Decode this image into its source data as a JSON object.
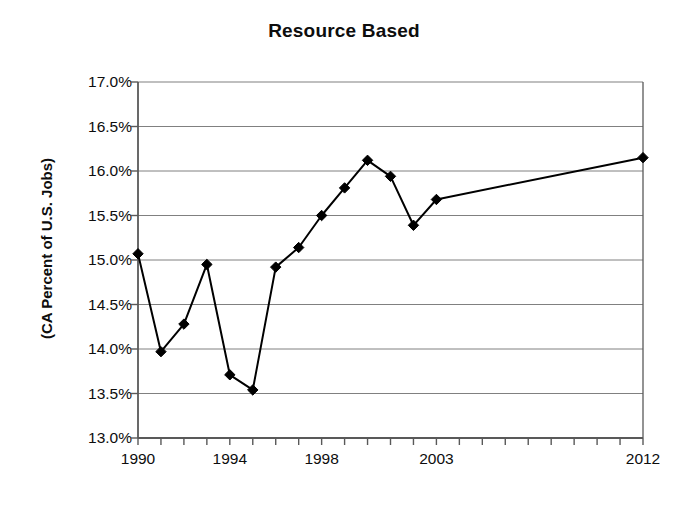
{
  "chart_data": {
    "type": "line",
    "title": "Resource Based",
    "xlabel": "",
    "ylabel": "(CA Percent of U.S. Jobs)",
    "ylim": [
      13.0,
      17.0
    ],
    "xlim": [
      1990,
      2012
    ],
    "grid": true,
    "legend": "none",
    "marker": "diamond",
    "line_color": "#000000",
    "marker_color": "#000000",
    "grid_color": "#808080",
    "axis_color": "#595959",
    "y_ticks": [
      13.0,
      13.5,
      14.0,
      14.5,
      15.0,
      15.5,
      16.0,
      16.5,
      17.0
    ],
    "y_tick_labels": [
      "13.0%",
      "13.5%",
      "14.0%",
      "14.5%",
      "15.0%",
      "15.5%",
      "16.0%",
      "16.5%",
      "17.0%"
    ],
    "x_ticks": [
      1990,
      1991,
      1992,
      1993,
      1994,
      1995,
      1996,
      1997,
      1998,
      1999,
      2000,
      2001,
      2002,
      2003,
      2004,
      2005,
      2006,
      2007,
      2008,
      2009,
      2010,
      2011,
      2012
    ],
    "x_tick_labels_shown": [
      "1990",
      "1994",
      "1998",
      "2003",
      "2012"
    ],
    "x_tick_labels_shown_values": [
      1990,
      1994,
      1998,
      2003,
      2012
    ],
    "x": [
      1990,
      1991,
      1992,
      1993,
      1994,
      1995,
      1996,
      1997,
      1998,
      1999,
      2000,
      2001,
      2002,
      2003,
      2012
    ],
    "values": [
      15.07,
      13.97,
      14.28,
      14.95,
      13.71,
      13.54,
      14.92,
      15.14,
      15.5,
      15.81,
      16.12,
      15.94,
      15.39,
      15.68,
      16.15
    ],
    "series": [
      {
        "name": "Resource Based",
        "x": [
          1990,
          1991,
          1992,
          1993,
          1994,
          1995,
          1996,
          1997,
          1998,
          1999,
          2000,
          2001,
          2002,
          2003,
          2012
        ],
        "values": [
          15.07,
          13.97,
          14.28,
          14.95,
          13.71,
          13.54,
          14.92,
          15.14,
          15.5,
          15.81,
          16.12,
          15.94,
          15.39,
          15.68,
          16.15
        ]
      }
    ]
  }
}
